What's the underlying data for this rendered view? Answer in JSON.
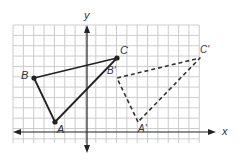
{
  "diagram": {
    "type": "coordinate-plane-translation",
    "grid": {
      "left": 13,
      "top": 25,
      "right": 199,
      "bottom": 143,
      "cell": 10.35,
      "line_color": "#cccccc"
    },
    "axes": {
      "x_axis_y": 132,
      "y_axis_x": 87,
      "x_label": "x",
      "y_label": "y",
      "color": "#222222"
    },
    "original_triangle": {
      "style": "solid",
      "color": "#222222",
      "vertices": [
        {
          "name": "A",
          "label": "A",
          "px": [
            55,
            122
          ]
        },
        {
          "name": "B",
          "label": "B",
          "px": [
            34,
            78
          ]
        },
        {
          "name": "C",
          "label": "C",
          "px": [
            117,
            58
          ]
        }
      ]
    },
    "image_triangle": {
      "style": "dashed",
      "color": "#333333",
      "vertices": [
        {
          "name": "A'",
          "label": "A'",
          "px": [
            138,
            122
          ]
        },
        {
          "name": "B'",
          "label": "B'",
          "px": [
            117,
            78
          ]
        },
        {
          "name": "C'",
          "label": "C'",
          "px": [
            200,
            58
          ]
        }
      ]
    },
    "labels": {
      "A": "A",
      "B": "B",
      "C": "C",
      "A_prime": "A'",
      "B_prime": "B'",
      "C_prime": "C'",
      "x": "x",
      "y": "y"
    }
  }
}
